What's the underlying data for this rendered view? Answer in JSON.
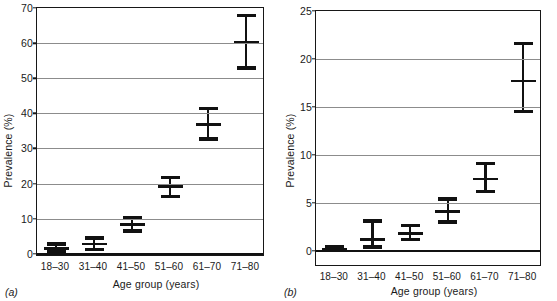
{
  "figure": {
    "panels": [
      {
        "tag": "(a)",
        "ylabel": "Prevalence (%)",
        "xlabel": "Age group (years)",
        "yticks": [
          0,
          10,
          20,
          30,
          40,
          50,
          60,
          70
        ],
        "ymin": 0,
        "ymax": 70
      },
      {
        "tag": "(b)",
        "ylabel": "Prevalence (%)",
        "xlabel": "Age group (years)",
        "yticks": [
          0,
          5,
          10,
          15,
          20,
          25
        ],
        "ymin": 0,
        "ymax": 25
      }
    ]
  },
  "chart_data": [
    {
      "type": "scatter",
      "panel": "(a)",
      "title": "",
      "xlabel": "Age group (years)",
      "ylabel": "Prevalence (%)",
      "categories": [
        "18–30",
        "31–40",
        "41–50",
        "51–60",
        "61–70",
        "71–80"
      ],
      "values": [
        1.5,
        2.8,
        8.4,
        19.1,
        36.9,
        60.3
      ],
      "error_low": [
        0.5,
        1.3,
        6.5,
        16.3,
        32.7,
        52.9
      ],
      "error_high": [
        2.8,
        4.5,
        10.3,
        21.8,
        41.3,
        67.8
      ],
      "ylim": [
        0,
        70
      ],
      "yticks": [
        0,
        10,
        20,
        30,
        40,
        50,
        60,
        70
      ],
      "grid": true,
      "legend": "none",
      "errorbars": "95% confidence interval"
    },
    {
      "type": "scatter",
      "panel": "(b)",
      "title": "",
      "xlabel": "Age group (years)",
      "ylabel": "Prevalence (%)",
      "categories": [
        "18–30",
        "31–40",
        "41–50",
        "51–60",
        "61–70",
        "71–80"
      ],
      "values": [
        0.2,
        1.2,
        1.8,
        4.1,
        7.5,
        17.7
      ],
      "error_low": [
        0.1,
        0.4,
        1.2,
        3.0,
        6.2,
        14.5
      ],
      "error_high": [
        0.4,
        3.1,
        2.6,
        5.4,
        9.1,
        21.6
      ],
      "ylim": [
        0,
        25
      ],
      "yticks": [
        0,
        5,
        10,
        15,
        20,
        25
      ],
      "grid": true,
      "legend": "none",
      "errorbars": "95% confidence interval"
    }
  ]
}
